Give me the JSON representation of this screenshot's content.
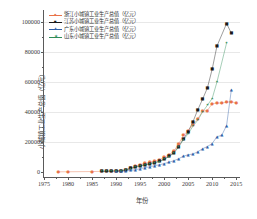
{
  "axes": {
    "y_title": "小城镇工业生产总值（亿元）",
    "x_title": "年份",
    "y_ticks": [
      "0",
      "20000",
      "40000",
      "60000",
      "80000",
      "100000"
    ],
    "x_ticks": [
      "1975",
      "1980",
      "1985",
      "1990",
      "1995",
      "2000",
      "2005",
      "2010",
      "2015"
    ]
  },
  "legend": {
    "items": [
      {
        "label": "浙江小城镇工业生产总值（亿元）",
        "color": "#E8734A",
        "marker": "●"
      },
      {
        "label": "江苏小城镇工业生产总值（亿元）",
        "color": "#1A1A1A",
        "marker": "■"
      },
      {
        "label": "广东小城镇工业生产总值（亿元）",
        "color": "#2F5FA8",
        "marker": "▲"
      },
      {
        "label": "山东小城镇工业生产总值（亿元）",
        "color": "#2E8B57",
        "marker": "✶"
      }
    ]
  },
  "chart_data": {
    "type": "line",
    "title": "",
    "xlabel": "年份",
    "ylabel": "小城镇工业生产总值（亿元）",
    "xlim": [
      1975,
      2016
    ],
    "ylim": [
      -4000,
      108000
    ],
    "grid": true,
    "legend_position": "top-left",
    "series": [
      {
        "name": "浙江小城镇工业生产总值（亿元）",
        "color": "#E8734A",
        "marker": "circle",
        "points": [
          [
            1978,
            120
          ],
          [
            1980,
            150
          ],
          [
            1985,
            300
          ],
          [
            1987,
            420
          ],
          [
            1988,
            560
          ],
          [
            1989,
            640
          ],
          [
            1990,
            700
          ],
          [
            1991,
            900
          ],
          [
            1992,
            1500
          ],
          [
            1993,
            2600
          ],
          [
            1994,
            3900
          ],
          [
            1995,
            5000
          ],
          [
            1996,
            5800
          ],
          [
            1997,
            6500
          ],
          [
            1998,
            7200
          ],
          [
            1999,
            8200
          ],
          [
            2000,
            9800
          ],
          [
            2001,
            11500
          ],
          [
            2002,
            14000
          ],
          [
            2003,
            18500
          ],
          [
            2004,
            24500
          ],
          [
            2005,
            27500
          ],
          [
            2006,
            31500
          ],
          [
            2007,
            35500
          ],
          [
            2008,
            40500
          ],
          [
            2009,
            41000
          ],
          [
            2010,
            45500
          ],
          [
            2011,
            46000
          ],
          [
            2012,
            46000
          ],
          [
            2013,
            46500
          ],
          [
            2014,
            47000
          ],
          [
            2015,
            45800
          ]
        ]
      },
      {
        "name": "江苏小城镇工业生产总值（亿元）",
        "color": "#1A1A1A",
        "marker": "square",
        "points": [
          [
            1987,
            400
          ],
          [
            1988,
            520
          ],
          [
            1989,
            600
          ],
          [
            1990,
            680
          ],
          [
            1991,
            850
          ],
          [
            1992,
            1400
          ],
          [
            1993,
            2400
          ],
          [
            1994,
            3300
          ],
          [
            1995,
            4200
          ],
          [
            1996,
            4900
          ],
          [
            1997,
            5600
          ],
          [
            1998,
            6300
          ],
          [
            1999,
            7100
          ],
          [
            2000,
            8600
          ],
          [
            2001,
            10500
          ],
          [
            2002,
            13000
          ],
          [
            2003,
            17000
          ],
          [
            2004,
            22000
          ],
          [
            2005,
            27000
          ],
          [
            2006,
            33500
          ],
          [
            2007,
            41500
          ],
          [
            2008,
            48500
          ],
          [
            2009,
            56000
          ],
          [
            2010,
            68500
          ],
          [
            2011,
            84000
          ],
          [
            2013,
            99000
          ],
          [
            2014,
            92500
          ]
        ]
      },
      {
        "name": "广东小城镇工业生产总值（亿元）",
        "color": "#2F5FA8",
        "marker": "triangle",
        "points": [
          [
            1990,
            350
          ],
          [
            1991,
            450
          ],
          [
            1992,
            700
          ],
          [
            1993,
            1100
          ],
          [
            1994,
            1500
          ],
          [
            1995,
            2200
          ],
          [
            1996,
            2900
          ],
          [
            1997,
            3500
          ],
          [
            1998,
            4200
          ],
          [
            1999,
            4800
          ],
          [
            2000,
            5600
          ],
          [
            2001,
            6500
          ],
          [
            2002,
            7500
          ],
          [
            2003,
            8800
          ],
          [
            2004,
            10500
          ],
          [
            2005,
            11500
          ],
          [
            2006,
            12000
          ],
          [
            2007,
            13500
          ],
          [
            2008,
            15500
          ],
          [
            2009,
            17000
          ],
          [
            2010,
            19000
          ],
          [
            2011,
            23500
          ],
          [
            2012,
            24500
          ],
          [
            2013,
            31000
          ],
          [
            2014,
            55000
          ]
        ]
      },
      {
        "name": "山东小城镇工业生产总值（亿元）",
        "color": "#2E8B57",
        "marker": "star",
        "points": [
          [
            1987,
            380
          ],
          [
            1988,
            500
          ],
          [
            1989,
            580
          ],
          [
            1990,
            650
          ],
          [
            1991,
            800
          ],
          [
            1992,
            1300
          ],
          [
            1993,
            2200
          ],
          [
            1994,
            3100
          ],
          [
            1995,
            4000
          ],
          [
            1996,
            4700
          ],
          [
            1997,
            5400
          ],
          [
            1998,
            6100
          ],
          [
            1999,
            7000
          ],
          [
            2000,
            8400
          ],
          [
            2001,
            10200
          ],
          [
            2002,
            12500
          ],
          [
            2003,
            16500
          ],
          [
            2004,
            21500
          ],
          [
            2005,
            25500
          ],
          [
            2006,
            30500
          ],
          [
            2007,
            34500
          ],
          [
            2008,
            40000
          ],
          [
            2009,
            44500
          ],
          [
            2010,
            49000
          ],
          [
            2011,
            60000
          ],
          [
            2013,
            86000
          ]
        ]
      }
    ]
  }
}
